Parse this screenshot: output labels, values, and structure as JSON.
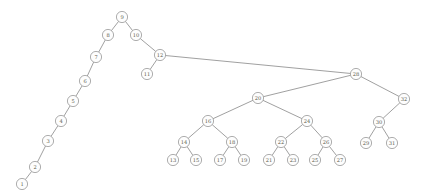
{
  "figure": {
    "title": "",
    "kind": "binary-search-tree-graph-drawing",
    "background_color": "#ffffff",
    "node_fill_color": "#fdfdfd",
    "node_stroke_color": "#8a8a8a",
    "edge_color": "#777777",
    "label_color": "#5a5a4a",
    "node_radius": 5.6,
    "width": 429,
    "height": 195
  },
  "graph": {
    "root": "9",
    "node_count": 32,
    "edge_count": 31,
    "nodes": [
      {
        "id": "1",
        "label": "1",
        "x": 22,
        "y": 184
      },
      {
        "id": "2",
        "label": "2",
        "x": 35,
        "y": 167
      },
      {
        "id": "3",
        "label": "3",
        "x": 48,
        "y": 141
      },
      {
        "id": "4",
        "label": "4",
        "x": 61,
        "y": 121
      },
      {
        "id": "5",
        "label": "5",
        "x": 73,
        "y": 101
      },
      {
        "id": "6",
        "label": "6",
        "x": 85,
        "y": 81
      },
      {
        "id": "7",
        "label": "7",
        "x": 96,
        "y": 57
      },
      {
        "id": "8",
        "label": "8",
        "x": 108,
        "y": 35
      },
      {
        "id": "9",
        "label": "9",
        "x": 122,
        "y": 17
      },
      {
        "id": "10",
        "label": "10",
        "x": 136,
        "y": 35
      },
      {
        "id": "11",
        "label": "11",
        "x": 147,
        "y": 74
      },
      {
        "id": "12",
        "label": "12",
        "x": 160,
        "y": 55
      },
      {
        "id": "13",
        "label": "13",
        "x": 173,
        "y": 160
      },
      {
        "id": "14",
        "label": "14",
        "x": 184,
        "y": 142
      },
      {
        "id": "15",
        "label": "15",
        "x": 196,
        "y": 160
      },
      {
        "id": "16",
        "label": "16",
        "x": 208,
        "y": 121
      },
      {
        "id": "17",
        "label": "17",
        "x": 220,
        "y": 160
      },
      {
        "id": "18",
        "label": "18",
        "x": 232,
        "y": 142
      },
      {
        "id": "19",
        "label": "19",
        "x": 244,
        "y": 160
      },
      {
        "id": "20",
        "label": "20",
        "x": 258,
        "y": 98
      },
      {
        "id": "21",
        "label": "21",
        "x": 269,
        "y": 160
      },
      {
        "id": "22",
        "label": "22",
        "x": 281,
        "y": 142
      },
      {
        "id": "23",
        "label": "23",
        "x": 293,
        "y": 160
      },
      {
        "id": "24",
        "label": "24",
        "x": 307,
        "y": 121
      },
      {
        "id": "25",
        "label": "25",
        "x": 315,
        "y": 160
      },
      {
        "id": "26",
        "label": "26",
        "x": 326,
        "y": 142
      },
      {
        "id": "27",
        "label": "27",
        "x": 340,
        "y": 160
      },
      {
        "id": "28",
        "label": "28",
        "x": 356,
        "y": 74
      },
      {
        "id": "29",
        "label": "29",
        "x": 366,
        "y": 143
      },
      {
        "id": "30",
        "label": "30",
        "x": 379,
        "y": 122
      },
      {
        "id": "31",
        "label": "31",
        "x": 392,
        "y": 143
      },
      {
        "id": "32",
        "label": "32",
        "x": 404,
        "y": 99
      }
    ],
    "edges": [
      {
        "source": "9",
        "target": "8"
      },
      {
        "source": "9",
        "target": "10"
      },
      {
        "source": "8",
        "target": "7"
      },
      {
        "source": "7",
        "target": "6"
      },
      {
        "source": "6",
        "target": "5"
      },
      {
        "source": "5",
        "target": "4"
      },
      {
        "source": "4",
        "target": "3"
      },
      {
        "source": "3",
        "target": "2"
      },
      {
        "source": "2",
        "target": "1"
      },
      {
        "source": "10",
        "target": "12"
      },
      {
        "source": "12",
        "target": "11"
      },
      {
        "source": "12",
        "target": "28"
      },
      {
        "source": "28",
        "target": "20"
      },
      {
        "source": "28",
        "target": "32"
      },
      {
        "source": "20",
        "target": "16"
      },
      {
        "source": "20",
        "target": "24"
      },
      {
        "source": "16",
        "target": "14"
      },
      {
        "source": "16",
        "target": "18"
      },
      {
        "source": "14",
        "target": "13"
      },
      {
        "source": "14",
        "target": "15"
      },
      {
        "source": "18",
        "target": "17"
      },
      {
        "source": "18",
        "target": "19"
      },
      {
        "source": "24",
        "target": "22"
      },
      {
        "source": "24",
        "target": "26"
      },
      {
        "source": "22",
        "target": "21"
      },
      {
        "source": "22",
        "target": "23"
      },
      {
        "source": "26",
        "target": "25"
      },
      {
        "source": "26",
        "target": "27"
      },
      {
        "source": "32",
        "target": "30"
      },
      {
        "source": "30",
        "target": "29"
      },
      {
        "source": "30",
        "target": "31"
      }
    ]
  }
}
